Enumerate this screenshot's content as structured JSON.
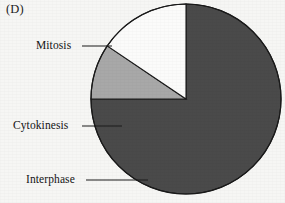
{
  "figure": {
    "panel_label": "(D)",
    "background_color": "#f6f6f4",
    "outline_color": "#1a1a1a"
  },
  "chart_data": {
    "type": "pie",
    "title": "(D)",
    "xlabel": "",
    "ylabel": "",
    "legend_position": "callout-labels-left",
    "grid": false,
    "center": {
      "x": 186,
      "y": 99
    },
    "radius": 95,
    "start_angle_deg": 180,
    "direction": "clockwise",
    "categories": [
      "Cytokinesis",
      "Interphase",
      "Mitosis"
    ],
    "values": [
      9.4,
      15.6,
      75.0
    ],
    "units": "percent of cell cycle",
    "slices": [
      {
        "label": "Cytokinesis",
        "value": 9.4,
        "start_angle_deg": 180,
        "end_angle_deg": 214,
        "sweep_deg": 34,
        "color": "#a8a8a8"
      },
      {
        "label": "Interphase",
        "value": 15.6,
        "start_angle_deg": 214,
        "end_angle_deg": 270,
        "sweep_deg": 56,
        "color": "#fbfbfa"
      },
      {
        "label": "Mitosis",
        "value": 75.0,
        "start_angle_deg": 270,
        "end_angle_deg": 540,
        "sweep_deg": 270,
        "color": "#4a4a4a"
      }
    ],
    "annotations": [
      {
        "text": "Mitosis",
        "label_x": 36,
        "label_y": 46,
        "leader_from_x": 82,
        "leader_from_y": 46,
        "leader_to_x": 112,
        "leader_to_y": 46
      },
      {
        "text": "Cytokinesis",
        "label_x": 13,
        "label_y": 126,
        "leader_from_x": 82,
        "leader_from_y": 126,
        "leader_to_x": 122,
        "leader_to_y": 126
      },
      {
        "text": "Interphase",
        "label_x": 26,
        "label_y": 180,
        "leader_from_x": 86,
        "leader_from_y": 180,
        "leader_to_x": 148,
        "leader_to_y": 180
      }
    ]
  },
  "labels": {
    "mitosis": "Mitosis",
    "cytokinesis": "Cytokinesis",
    "interphase": "Interphase"
  }
}
